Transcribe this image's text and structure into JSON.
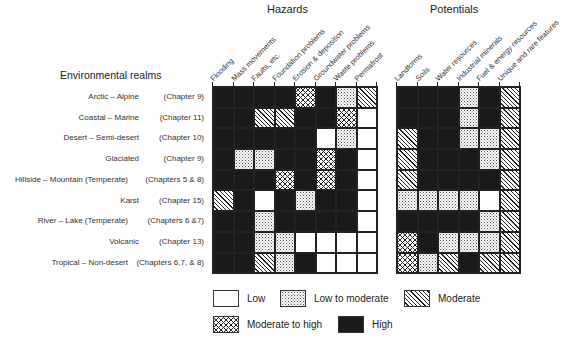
{
  "headers": {
    "hazards": "Hazards",
    "potentials": "Potentials",
    "realms": "Environmental realms"
  },
  "hazard_columns": [
    "Flooding",
    "Mass movements",
    "Faults, etc.",
    "Foundation problems",
    "Erosion & deposition",
    "Groundwater problems",
    "Waste problems",
    "Permafrost"
  ],
  "potential_columns": [
    "Landforms",
    "Soils",
    "Water resources",
    "Industrial minerals",
    "Fuel & energy resources",
    "Unique and rare features"
  ],
  "rows": [
    {
      "name": "Arctic – Alpine",
      "chapter": "(Chapter 9)",
      "hazards": [
        "H",
        "H",
        "H",
        "H",
        "MH",
        "H",
        "LM",
        "M"
      ],
      "potentials": [
        "H",
        "H",
        "H",
        "LM",
        "H",
        "M"
      ]
    },
    {
      "name": "Coastal – Marine",
      "chapter": "(Chapter 11)",
      "hazards": [
        "H",
        "H",
        "M",
        "M",
        "H",
        "H",
        "MH",
        "L"
      ],
      "potentials": [
        "H",
        "H",
        "H",
        "LM",
        "H",
        "M"
      ]
    },
    {
      "name": "Desert – Semi-desert",
      "chapter": "(Chapter 10)",
      "hazards": [
        "H",
        "H",
        "H",
        "H",
        "H",
        "L",
        "LM",
        "L"
      ],
      "potentials": [
        "M",
        "H",
        "H",
        "LM",
        "LM",
        "M"
      ]
    },
    {
      "name": "Glaciated",
      "chapter": "(Chapter 9)",
      "hazards": [
        "H",
        "LM",
        "LM",
        "H",
        "H",
        "MH",
        "H",
        "L"
      ],
      "potentials": [
        "M",
        "H",
        "H",
        "H",
        "LM",
        "M"
      ]
    },
    {
      "name": "Hillside – Mountain (Temperate)",
      "chapter": "(Chapters 5 & 8)",
      "hazards": [
        "H",
        "H",
        "H",
        "MH",
        "H",
        "MH",
        "H",
        "L"
      ],
      "potentials": [
        "M",
        "H",
        "H",
        "H",
        "H",
        "M"
      ]
    },
    {
      "name": "Karst",
      "chapter": "(Chapter 15)",
      "hazards": [
        "M",
        "H",
        "L",
        "H",
        "LM",
        "H",
        "H",
        "L"
      ],
      "potentials": [
        "LM",
        "LM",
        "LM",
        "LM",
        "L",
        "M"
      ]
    },
    {
      "name": "River – Lake (Temperate)",
      "chapter": "(Chapters 6 &7)",
      "hazards": [
        "H",
        "H",
        "LM",
        "H",
        "H",
        "H",
        "H",
        "L"
      ],
      "potentials": [
        "H",
        "H",
        "H",
        "H",
        "LM",
        "M"
      ]
    },
    {
      "name": "Volcanic",
      "chapter": "(Chapter 13)",
      "hazards": [
        "H",
        "H",
        "LM",
        "LM",
        "L",
        "L",
        "L",
        "L"
      ],
      "potentials": [
        "MH",
        "H",
        "LM",
        "LM",
        "LM",
        "M"
      ]
    },
    {
      "name": "Tropical – Non-desert",
      "chapter": "(Chapters 6,7, & 8)",
      "hazards": [
        "H",
        "H",
        "M",
        "LM",
        "H",
        "L",
        "L",
        "L"
      ],
      "potentials": [
        "MH",
        "LM",
        "M",
        "H",
        "M",
        "M"
      ]
    }
  ],
  "legend": [
    {
      "code": "L",
      "label": "Low"
    },
    {
      "code": "LM",
      "label": "Low to moderate"
    },
    {
      "code": "M",
      "label": "Moderate"
    },
    {
      "code": "MH",
      "label": "Moderate to high"
    },
    {
      "code": "H",
      "label": "High"
    }
  ]
}
